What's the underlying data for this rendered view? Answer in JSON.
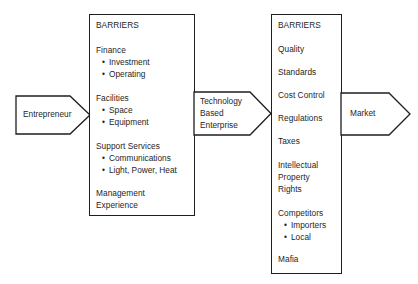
{
  "diagram": {
    "type": "flow-diagram",
    "background_color": "#ffffff",
    "line_color": "#1e1e1e",
    "text_color": "#262626"
  },
  "input_arrow": {
    "label": "Entrepreneur",
    "direction": "right"
  },
  "barriers_internal": {
    "heading": "BARRIERS",
    "groups": [
      {
        "name": "Finance",
        "items": [
          "Investment",
          "Operating"
        ]
      },
      {
        "name": "Facilities",
        "items": [
          "Space",
          "Equipment"
        ]
      },
      {
        "name": "Support Services",
        "items": [
          "Communications",
          "Light, Power, Heat"
        ]
      },
      {
        "name": "Management",
        "name_line2": "Experience",
        "items": []
      }
    ]
  },
  "middle_arrow": {
    "line1": "Technology",
    "line2": "Based",
    "line3": "Enterprise",
    "direction": "right"
  },
  "barriers_external": {
    "heading": "BARRIERS",
    "groups": [
      {
        "name": "Quality",
        "items": []
      },
      {
        "name": "Standards",
        "items": []
      },
      {
        "name": "Cost Control",
        "items": []
      },
      {
        "name": "Regulations",
        "items": []
      },
      {
        "name": "Taxes",
        "items": []
      },
      {
        "name": "Intellectual",
        "name_line2": "Property",
        "name_line3": "Rights",
        "items": []
      },
      {
        "name": "Competitors",
        "items": [
          "Importers",
          "Local"
        ]
      },
      {
        "name": "Mafia",
        "items": []
      }
    ]
  },
  "output_arrow": {
    "label": "Market",
    "direction": "right"
  },
  "bullet_glyph": "•"
}
